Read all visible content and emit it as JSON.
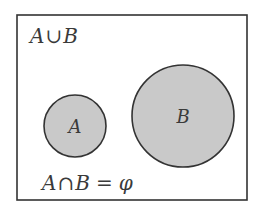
{
  "diagram": {
    "type": "venn",
    "universe_label": {
      "left": "A",
      "op": "∪",
      "right": "B"
    },
    "sets": [
      {
        "id": "A",
        "label": "A",
        "cx": 75,
        "cy": 126,
        "r": 31
      },
      {
        "id": "B",
        "label": "B",
        "cx": 183,
        "cy": 116,
        "r": 51
      }
    ],
    "relation": {
      "left": "A",
      "op": "∩",
      "right": "B",
      "equals": "=",
      "result": "φ"
    },
    "colors": {
      "border": "#333333",
      "fill": "#c9c9c9",
      "text": "#3a3a3a",
      "background": "#ffffff"
    }
  }
}
